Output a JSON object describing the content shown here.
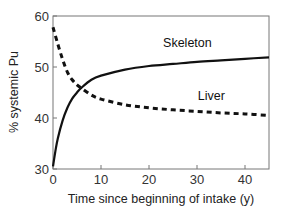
{
  "chart_data": {
    "type": "line",
    "title": "",
    "xlabel": "Time since beginning of intake (y)",
    "ylabel": "% systemic Pu",
    "xlim": [
      0,
      45
    ],
    "ylim": [
      30,
      60
    ],
    "xticks": [
      0,
      10,
      20,
      30,
      40
    ],
    "yticks": [
      30,
      40,
      50,
      60
    ],
    "grid": false,
    "legend": "inline labels",
    "series": [
      {
        "name": "Skeleton",
        "style": "solid",
        "x": [
          0,
          0.5,
          1,
          2,
          3,
          4,
          5,
          6,
          8,
          10,
          15,
          20,
          25,
          30,
          35,
          40,
          45
        ],
        "values": [
          30.5,
          33.5,
          36,
          39.5,
          42,
          43.8,
          45,
          46,
          47.5,
          48.3,
          49.5,
          50.2,
          50.6,
          51,
          51.3,
          51.6,
          51.9
        ]
      },
      {
        "name": "Liver",
        "style": "dashed",
        "x": [
          0,
          1,
          2,
          3,
          4,
          5,
          6,
          8,
          10,
          15,
          20,
          25,
          30,
          35,
          40,
          45
        ],
        "values": [
          57.8,
          54.5,
          51.5,
          49,
          47.5,
          46.5,
          45.8,
          44.5,
          43.7,
          42.6,
          42,
          41.6,
          41.3,
          41,
          40.8,
          40.5
        ]
      }
    ],
    "annotations": [
      {
        "text": "Skeleton",
        "x": 28,
        "y": 54
      },
      {
        "text": "Liver",
        "x": 33,
        "y": 43.5
      }
    ]
  }
}
